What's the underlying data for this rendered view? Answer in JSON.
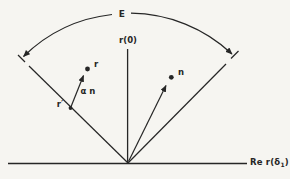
{
  "figure": {
    "labels": {
      "arc": "E",
      "vertical_ray": "r(0)",
      "r_point": "r",
      "alpha_n_vector": "α n",
      "r_prime_point": "r′",
      "n_vector": "n",
      "real_axis_pre": "Re r(δ",
      "real_axis_sub": "1",
      "real_axis_post": ")"
    },
    "colors": {
      "ink": "#262626",
      "paper": "#f6f5f1"
    }
  }
}
